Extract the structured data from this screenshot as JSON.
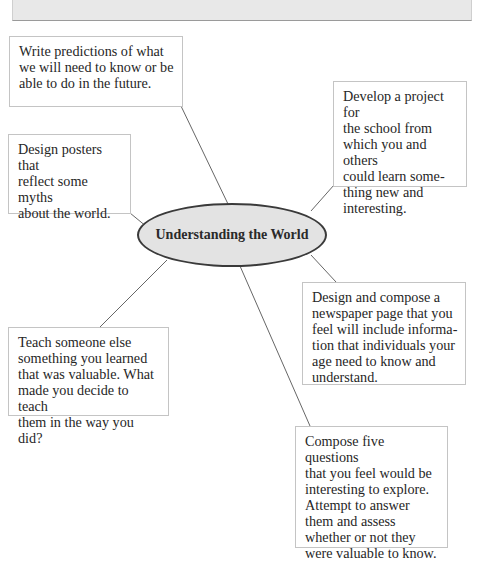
{
  "diagram": {
    "type": "mind-map",
    "center": {
      "label": "Understanding the World"
    },
    "nodes": [
      {
        "id": "predictions",
        "text": "Write predictions of what\nwe will need to know or be\nable to do in the future."
      },
      {
        "id": "project",
        "text": "Develop a project for\nthe school from\nwhich you and others\ncould learn some-\nthing new and\ninteresting."
      },
      {
        "id": "posters",
        "text": "Design posters that\nreflect some myths\nabout the world."
      },
      {
        "id": "newspaper",
        "text": "Design and compose a\nnewspaper page that you\nfeel will include informa-\ntion that individuals your\nage need to know and\nunderstand."
      },
      {
        "id": "teach",
        "text": "Teach someone else\nsomething you learned\nthat was valuable.  What\nmade you decide to teach\nthem in the way you did?"
      },
      {
        "id": "questions",
        "text": "Compose five questions\nthat you feel would be\ninteresting to explore.\nAttempt to answer\nthem and assess\nwhether or not they\nwere valuable to know."
      }
    ]
  },
  "colors": {
    "hub_fill": "#e3e3e3",
    "hub_border": "#3a3a3a",
    "box_border": "#c4c4c4",
    "line": "#555555",
    "band": "#e8e8e8"
  }
}
